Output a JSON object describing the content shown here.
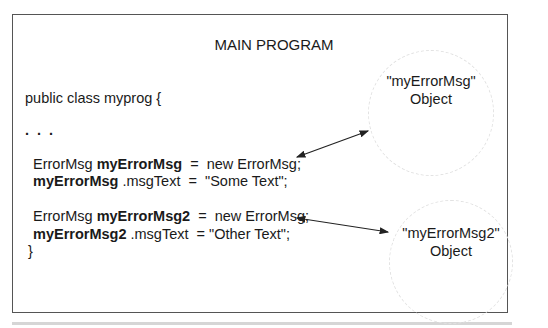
{
  "diagram": {
    "title": "MAIN PROGRAM",
    "code": {
      "class_decl": "public class myprog {",
      "ellipsis": ". . .",
      "line1": {
        "type": "ErrorMsg ",
        "var": "myErrorMsg",
        "rest": "  =  new ErrorMsg;"
      },
      "line2": {
        "var": "myErrorMsg",
        "rest": " .msgText  =  \"Some Text\";"
      },
      "line3": {
        "type": "ErrorMsg ",
        "var": "myErrorMsg2",
        "rest": "  =  new ErrorMsg;"
      },
      "line4": {
        "var": "myErrorMsg2",
        "rest": " .msgText  = \"Other Text\";"
      },
      "closing_brace": "}"
    },
    "objects": [
      {
        "name": "\"myErrorMsg\"",
        "label": "Object"
      },
      {
        "name": "\"myErrorMsg2\"",
        "label": "Object"
      }
    ],
    "colors": {
      "frame": "#555555",
      "text": "#1a1a1a",
      "circle": "#e2e2e2",
      "arrow": "#222222"
    }
  }
}
